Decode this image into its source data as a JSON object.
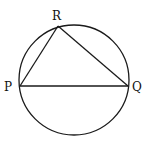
{
  "diagram": {
    "type": "circle-inscribed-triangle",
    "circle": {
      "cx": 74,
      "cy": 80,
      "r": 55,
      "stroke": "#1a1a1a"
    },
    "points": [
      {
        "id": "P",
        "label": "P",
        "x": 20,
        "y": 86,
        "label_x": 4,
        "label_y": 91
      },
      {
        "id": "Q",
        "label": "Q",
        "x": 128,
        "y": 86,
        "label_x": 132,
        "label_y": 91
      },
      {
        "id": "R",
        "label": "R",
        "x": 58,
        "y": 26,
        "label_x": 52,
        "label_y": 20
      }
    ],
    "segments": [
      {
        "from": "P",
        "to": "Q",
        "label": "PQ"
      },
      {
        "from": "P",
        "to": "R",
        "label": "PR"
      },
      {
        "from": "R",
        "to": "Q",
        "label": "RQ"
      }
    ]
  }
}
